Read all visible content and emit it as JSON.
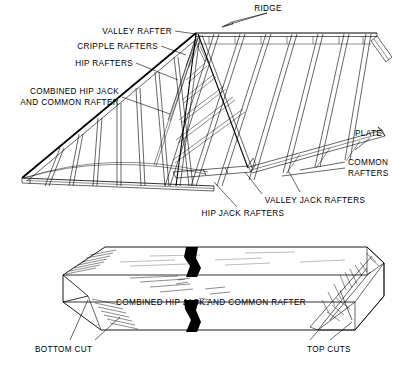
{
  "figure": {
    "background_color": "#ffffff",
    "line_color": "#000000"
  },
  "upper_diagram": {
    "name": "hip-and-valley-roof-framing",
    "labels": {
      "ridge": "RIDGE",
      "valley_rafter": "VALLEY RAFTER",
      "cripple_rafters": "CRIPPLE RAFTERS",
      "hip_rafters": "HIP RAFTERS",
      "combined_line1": "COMBINED HIP JACK",
      "combined_line2": "AND COMMON RAFTER",
      "plate": "PLATE",
      "common_line1": "COMMON",
      "common_line2": "RAFTERS",
      "hip_jack_rafters": "HIP JACK RAFTERS",
      "valley_jack_rafters": "VALLEY JACK RAFTERS"
    }
  },
  "lower_diagram": {
    "name": "rafter-cut-detail",
    "labels": {
      "member": "COMBINED HIP JACK AND COMMON RAFTER",
      "bottom_cut": "BOTTOM CUT",
      "top_cuts": "TOP CUTS"
    }
  }
}
